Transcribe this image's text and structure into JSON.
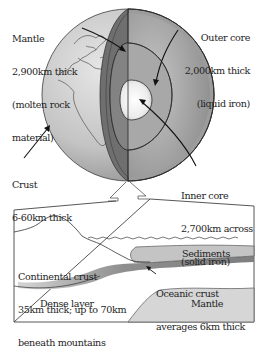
{
  "globe_labels": {
    "mantle": {
      "name": "Mantle",
      "detail1": "2,900km thick",
      "detail2": "(molten rock",
      "detail3": "material)"
    },
    "outer_core": {
      "name": "Outer core",
      "detail1": "2,000km thick",
      "detail2": "(liquid iron)"
    },
    "crust": {
      "name": "Crust",
      "detail1": "6-60km thick"
    },
    "inner_core": {
      "name": "Inner core",
      "detail1": "2,700km across",
      "detail2": "(solid iron)"
    }
  },
  "cross_section_labels": {
    "continental_crust": {
      "line1": "Continental crust",
      "line2": "35km thick; up to 70km",
      "line3": "beneath mountains"
    },
    "sediments": "Sediments",
    "oceanic_crust": {
      "line1": "Oceanic crust",
      "line2": "averages 6km thick"
    },
    "dense_layer": "Dense layer",
    "mantle": "Mantle"
  },
  "colors": {
    "globe_surface": "#c9c9c9",
    "mantle_layer": "#8a8a8a",
    "outer_core": "#a4a4a4",
    "inner_core": "#f2f2f2",
    "sediments": "#c4c4c4",
    "oceanic_crust": "#8c8c8c",
    "mantle_section": "#d6d6d6",
    "outline": "#2a2a2a"
  }
}
